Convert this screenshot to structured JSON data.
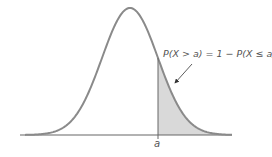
{
  "chart_data": {
    "type": "area",
    "title": "",
    "xlabel": "",
    "ylabel": "",
    "distribution": "normal",
    "curve_color": "#8a8a8a",
    "shade_color": "#d9d9d9",
    "axis_color": "#666666",
    "shaded_region": "x > a",
    "tick_labels": [
      "a"
    ],
    "annotation": "P(X > a) = 1 − P(X ≤ a)",
    "grid": false
  },
  "labels": {
    "annotation": "P(X > a) = 1 − P(X ≤ a)",
    "x_tick": "a"
  },
  "geometry": {
    "mean_px": 130,
    "sigma_px": 28,
    "peak_y": 8,
    "baseline_y": 135,
    "x_start": 20,
    "x_end": 232,
    "a_px": 158
  }
}
